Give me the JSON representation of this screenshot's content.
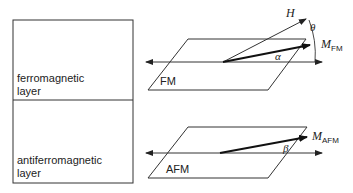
{
  "layers": {
    "ferromagnetic": {
      "line1": "ferromagnetic",
      "line2": "layer"
    },
    "antiferromagnetic": {
      "line1": "antiferromagnetic",
      "line2": "layer"
    }
  },
  "fm_panel": {
    "plane_label": "FM",
    "field_label": "H",
    "magnetization_label": "M",
    "magnetization_subscript": "FM",
    "angle_theta": "θ",
    "angle_alpha": "α"
  },
  "afm_panel": {
    "plane_label": "AFM",
    "magnetization_label": "M",
    "magnetization_subscript": "AFM",
    "angle_beta": "β"
  },
  "colors": {
    "line": "#222222",
    "vector": "#111111"
  }
}
